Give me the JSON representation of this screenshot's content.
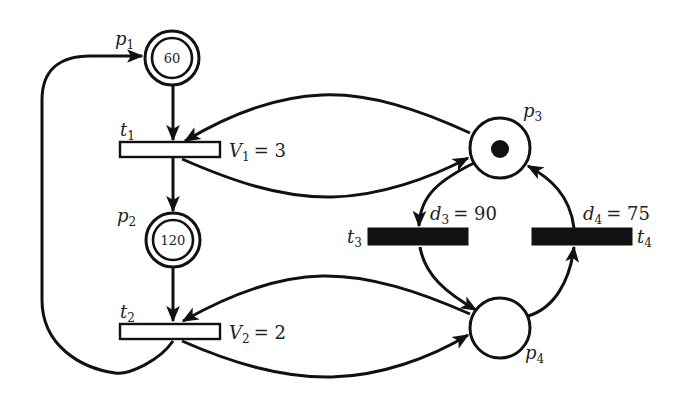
{
  "diagram": {
    "type": "petri-net",
    "colors": {
      "stroke": "#111111",
      "text": "#222222",
      "background": "#ffffff"
    },
    "places": [
      {
        "id": "p1",
        "name": "p",
        "sub": "1",
        "style": "double-circle",
        "value": "60"
      },
      {
        "id": "p2",
        "name": "p",
        "sub": "2",
        "style": "double-circle",
        "value": "120"
      },
      {
        "id": "p3",
        "name": "p",
        "sub": "3",
        "style": "circle",
        "tokens": 1
      },
      {
        "id": "p4",
        "name": "p",
        "sub": "4",
        "style": "circle",
        "tokens": 0
      }
    ],
    "transitions": [
      {
        "id": "t1",
        "name": "t",
        "sub": "1",
        "style": "open",
        "param_var": "V",
        "param_sub": "1",
        "param_value": "= 3"
      },
      {
        "id": "t2",
        "name": "t",
        "sub": "2",
        "style": "open",
        "param_var": "V",
        "param_sub": "2",
        "param_value": "= 2"
      },
      {
        "id": "t3",
        "name": "t",
        "sub": "3",
        "style": "filled",
        "param_var": "d",
        "param_sub": "3",
        "param_value": "= 90"
      },
      {
        "id": "t4",
        "name": "t",
        "sub": "4",
        "style": "filled",
        "param_var": "d",
        "param_sub": "4",
        "param_value": "= 75"
      }
    ],
    "arcs": [
      {
        "from": "p1",
        "to": "t1"
      },
      {
        "from": "t1",
        "to": "p2"
      },
      {
        "from": "p2",
        "to": "t2"
      },
      {
        "from": "t2",
        "to": "p1"
      },
      {
        "from": "p3",
        "to": "t1"
      },
      {
        "from": "t1",
        "to": "p3"
      },
      {
        "from": "p4",
        "to": "t2"
      },
      {
        "from": "t2",
        "to": "p4"
      },
      {
        "from": "p3",
        "to": "t3"
      },
      {
        "from": "t3",
        "to": "p4"
      },
      {
        "from": "p4",
        "to": "t4"
      },
      {
        "from": "t4",
        "to": "p3"
      }
    ]
  }
}
